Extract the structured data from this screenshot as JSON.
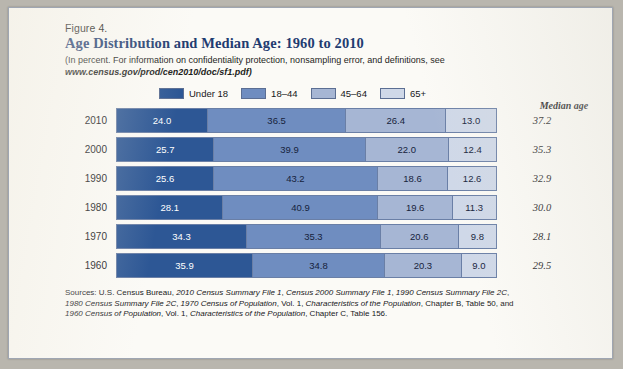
{
  "figure": {
    "label": "Figure 4.",
    "title": "Age Distribution and Median Age: 1960 to 2010",
    "subtitle_line1": "(In percent. For information on confidentiality protection, nonsampling error, and definitions, see",
    "subtitle_url": "www.census.gov/prod/cen2010/doc/sf1.pdf)"
  },
  "legend": {
    "items": [
      {
        "label": "Under 18",
        "color": "#2d5795"
      },
      {
        "label": "18–44",
        "color": "#6f8dc0"
      },
      {
        "label": "45–64",
        "color": "#a6b6d4"
      },
      {
        "label": "65+",
        "color": "#cfd8e8"
      }
    ]
  },
  "median_header": "Median age",
  "sources": {
    "line1_plain_a": "Sources: U.S. Census Bureau, ",
    "line1_it_a": "2010 Census Summary File 1",
    "line1_plain_b": ", ",
    "line1_it_b": "Census 2000 Summary File 1",
    "line1_plain_c": ", ",
    "line1_it_c": "1990 Census Summary File 2C",
    "line1_plain_d": ",",
    "line2_it_a": "1980 Census Summary File 2C",
    "line2_plain_a": ", ",
    "line2_it_b": "1970 Census of Population",
    "line2_plain_b": ", Vol. 1, ",
    "line2_it_c": "Characteristics of the Population",
    "line2_plain_c": ", Chapter B, Table 50, and",
    "line3_it_a": "1960 Census of Population",
    "line3_plain_a": ", Vol. 1, ",
    "line3_it_b": "Characteristics of the Population",
    "line3_plain_b": ", Chapter C, Table 156."
  },
  "chart_data": {
    "type": "bar",
    "orientation": "horizontal",
    "stacked": true,
    "title": "Age Distribution and Median Age: 1960 to 2010",
    "xlabel": "",
    "ylabel": "",
    "xlim": [
      0,
      100
    ],
    "grid": false,
    "legend_position": "top",
    "units": "percent",
    "categories": [
      "2010",
      "2000",
      "1990",
      "1980",
      "1970",
      "1960"
    ],
    "series": [
      {
        "name": "Under 18",
        "color": "#2d5795",
        "values": [
          24.0,
          25.7,
          25.6,
          28.1,
          34.3,
          35.9
        ]
      },
      {
        "name": "18–44",
        "color": "#6f8dc0",
        "values": [
          36.5,
          39.9,
          43.2,
          40.9,
          35.3,
          34.8
        ]
      },
      {
        "name": "45–64",
        "color": "#a6b6d4",
        "values": [
          26.4,
          22.0,
          18.6,
          19.6,
          20.6,
          20.3
        ]
      },
      {
        "name": "65+",
        "color": "#cfd8e8",
        "values": [
          13.0,
          12.4,
          12.6,
          11.3,
          9.8,
          9.0
        ]
      }
    ],
    "annotations": {
      "median_age_label": "Median age",
      "median_age": [
        37.2,
        35.3,
        32.9,
        30.0,
        28.1,
        29.5
      ]
    },
    "rows": [
      {
        "year": "2010",
        "segments": [
          "24.0",
          "36.5",
          "26.4",
          "13.0"
        ],
        "median": "37.2"
      },
      {
        "year": "2000",
        "segments": [
          "25.7",
          "39.9",
          "22.0",
          "12.4"
        ],
        "median": "35.3"
      },
      {
        "year": "1990",
        "segments": [
          "25.6",
          "43.2",
          "18.6",
          "12.6"
        ],
        "median": "32.9"
      },
      {
        "year": "1980",
        "segments": [
          "28.1",
          "40.9",
          "19.6",
          "11.3"
        ],
        "median": "30.0"
      },
      {
        "year": "1970",
        "segments": [
          "34.3",
          "35.3",
          "20.6",
          "9.8"
        ],
        "median": "28.1"
      },
      {
        "year": "1960",
        "segments": [
          "35.9",
          "34.8",
          "20.3",
          "9.0"
        ],
        "median": "29.5"
      }
    ]
  }
}
